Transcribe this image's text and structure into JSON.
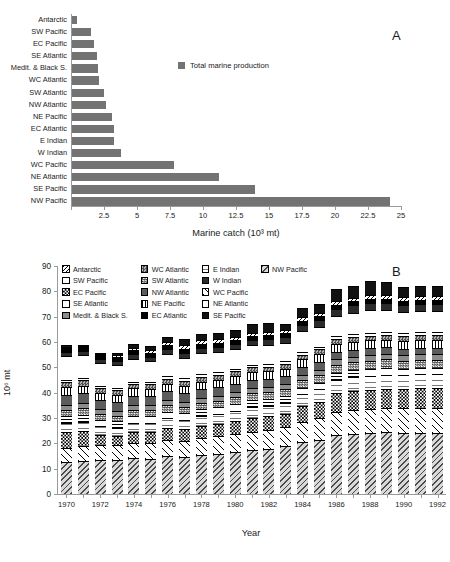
{
  "figure": {
    "panel_a_label": "A",
    "panel_b_label": "B"
  },
  "panel_a": {
    "legend_label": "Total marine production",
    "legend_color": "#737373",
    "xlabel": "Marine catch (10³ mt)",
    "xticks": [
      "",
      "2.5",
      "5",
      "7.5",
      "10",
      "12.5",
      "15",
      "17.5",
      "20",
      "22.5",
      "25"
    ]
  },
  "panel_b": {
    "ylabel": "10⁶ mt",
    "xlabel": "Year",
    "yticks": [
      "0",
      "10",
      "20",
      "30",
      "40",
      "50",
      "60",
      "70",
      "80",
      "90"
    ],
    "xticklabels": [
      "1970",
      "1972",
      "1974",
      "1976",
      "1978",
      "1980",
      "1982",
      "1984",
      "1986",
      "1988",
      "1990",
      "1992"
    ],
    "legend_columns": [
      [
        "Antarctic",
        "SW Pacific",
        "EC Pacific",
        "SE Atlantic",
        "Medit. & Black S."
      ],
      [
        "WC Atlantic",
        "SW Atlantic",
        "NW Atlantic",
        "NE Pacific",
        "EC Atlantic"
      ],
      [
        "E Indian",
        "W Indian",
        "WC Pacific",
        "NE Atlantic",
        "SE Pacific"
      ],
      [
        "NW Pacific"
      ]
    ]
  },
  "chart_data": [
    {
      "type": "bar",
      "orientation": "horizontal",
      "title": "A",
      "xlabel": "Marine catch (10³ mt)",
      "ylabel": "",
      "xlim": [
        0,
        25
      ],
      "xticks": [
        0,
        2.5,
        5,
        7.5,
        10,
        12.5,
        15,
        17.5,
        20,
        22.5,
        25
      ],
      "grid": false,
      "legend": [
        "Total marine production"
      ],
      "legend_position": "upper-center",
      "series_color": "#737373",
      "categories": [
        "Antarctic",
        "SW Pacific",
        "EC Pacific",
        "SE Atlantic",
        "Medit. & Black S.",
        "WC Atlantic",
        "SW Atlantic",
        "NW Atlantic",
        "NE Pacific",
        "EC Atlantic",
        "E Indian",
        "W Indian",
        "WC Pacific",
        "NE Atlantic",
        "SE Pacific",
        "NW Pacific"
      ],
      "values": [
        0.35,
        1.45,
        1.7,
        1.9,
        2.0,
        2.05,
        2.4,
        2.6,
        3.0,
        3.15,
        3.15,
        3.7,
        7.7,
        11.1,
        13.9,
        24.1
      ]
    },
    {
      "type": "bar",
      "subtype": "stacked",
      "title": "B",
      "xlabel": "Year",
      "ylabel": "10⁶ mt",
      "ylim": [
        0,
        90
      ],
      "yticks": [
        0,
        10,
        20,
        30,
        40,
        50,
        60,
        70,
        80,
        90
      ],
      "grid": false,
      "legend_position": "upper-left",
      "categories": [
        1970,
        1971,
        1972,
        1973,
        1974,
        1975,
        1976,
        1977,
        1978,
        1979,
        1980,
        1981,
        1982,
        1983,
        1984,
        1985,
        1986,
        1987,
        1988,
        1989,
        1990,
        1991,
        1992
      ],
      "totals": [
        59.0,
        59.0,
        55.8,
        55.8,
        59.2,
        58.6,
        62.0,
        61.2,
        63.2,
        63.6,
        64.6,
        67.0,
        67.6,
        67.2,
        73.6,
        75.0,
        81.0,
        82.0,
        84.2,
        83.6,
        81.8,
        82.0,
        82.0
      ],
      "series": [
        {
          "name": "NW Pacific",
          "pattern": "diagonal-hatch-gray",
          "values": [
            12.6,
            13.0,
            13.4,
            13.6,
            14.4,
            14.4,
            15.4,
            15.0,
            16.0,
            16.4,
            17.0,
            17.8,
            18.6,
            19.4,
            21.0,
            22.0,
            24.0,
            24.4,
            25.0,
            25.0,
            24.4,
            24.4,
            24.4
          ]
        },
        {
          "name": "WC Pacific",
          "pattern": "diagonal-sparse",
          "values": [
            5.6,
            5.8,
            5.8,
            5.6,
            6.0,
            6.2,
            6.6,
            6.8,
            7.0,
            7.2,
            7.4,
            7.6,
            7.8,
            8.0,
            8.4,
            8.8,
            9.2,
            9.4,
            9.6,
            9.8,
            9.8,
            10.0,
            10.0
          ]
        },
        {
          "name": "EC Pacific",
          "pattern": "checker-coarse",
          "values": [
            6.4,
            6.2,
            4.2,
            3.6,
            4.4,
            4.6,
            5.0,
            4.6,
            4.8,
            5.0,
            5.2,
            5.6,
            5.6,
            5.2,
            6.2,
            6.6,
            7.6,
            7.8,
            8.0,
            7.8,
            7.6,
            7.8,
            7.8
          ]
        },
        {
          "name": "E Indian",
          "pattern": "fine-grid",
          "values": [
            3.6,
            3.6,
            3.4,
            3.4,
            3.6,
            3.6,
            3.8,
            3.8,
            4.0,
            4.0,
            4.2,
            4.4,
            4.4,
            4.4,
            4.8,
            5.0,
            5.4,
            5.6,
            5.6,
            5.6,
            5.6,
            5.6,
            5.6
          ]
        },
        {
          "name": "SE Atlantic",
          "pattern": "grid",
          "values": [
            2.8,
            2.8,
            2.6,
            2.6,
            2.8,
            2.8,
            2.8,
            2.8,
            2.8,
            2.8,
            2.8,
            2.8,
            2.8,
            2.8,
            2.8,
            2.8,
            2.8,
            2.8,
            2.8,
            2.8,
            2.6,
            2.6,
            2.6
          ]
        },
        {
          "name": "SW Atlantic",
          "pattern": "checker-dark",
          "values": [
            2.4,
            2.4,
            2.2,
            2.2,
            2.4,
            2.4,
            2.6,
            2.6,
            2.6,
            2.6,
            2.8,
            2.8,
            2.8,
            2.8,
            3.0,
            3.0,
            3.2,
            3.2,
            3.4,
            3.4,
            3.2,
            3.2,
            3.2
          ]
        },
        {
          "name": "Medit. & Black S.",
          "pattern": "solid-gray",
          "values": [
            2.0,
            2.0,
            1.8,
            1.8,
            2.0,
            2.0,
            2.0,
            2.0,
            2.0,
            2.0,
            2.2,
            2.2,
            2.2,
            2.2,
            2.2,
            2.2,
            2.4,
            2.4,
            2.4,
            2.4,
            2.2,
            2.2,
            2.2
          ]
        },
        {
          "name": "NW Atlantic",
          "pattern": "solid-darkgray",
          "values": [
            4.0,
            4.0,
            3.6,
            3.6,
            3.8,
            3.6,
            3.6,
            3.4,
            3.4,
            3.4,
            3.2,
            3.2,
            3.2,
            3.0,
            3.0,
            3.0,
            2.8,
            2.8,
            2.8,
            2.6,
            2.6,
            2.6,
            2.6
          ]
        },
        {
          "name": "NE Pacific",
          "pattern": "vertical-stripe",
          "values": [
            3.0,
            3.0,
            2.8,
            2.8,
            3.0,
            3.0,
            3.2,
            3.2,
            3.2,
            3.2,
            3.2,
            3.2,
            3.2,
            3.2,
            3.2,
            3.2,
            3.2,
            3.2,
            3.2,
            3.0,
            3.0,
            3.0,
            3.0
          ]
        },
        {
          "name": "WC Atlantic",
          "pattern": "checker-light",
          "values": [
            2.2,
            2.2,
            2.0,
            2.0,
            2.0,
            2.0,
            2.0,
            2.0,
            2.0,
            2.0,
            2.0,
            2.0,
            2.0,
            2.0,
            2.0,
            2.0,
            2.0,
            2.0,
            2.0,
            2.0,
            2.0,
            2.0,
            2.0
          ]
        },
        {
          "name": "SW Pacific",
          "pattern": "white",
          "values": [
            0.8,
            0.8,
            0.8,
            0.8,
            0.8,
            0.8,
            1.0,
            1.0,
            1.0,
            1.0,
            1.0,
            1.0,
            1.0,
            1.0,
            1.0,
            1.0,
            1.2,
            1.2,
            1.2,
            1.2,
            1.2,
            1.2,
            1.2
          ]
        },
        {
          "name": "NE Atlantic",
          "pattern": "white-outline",
          "values": [
            9.6,
            9.2,
            9.0,
            9.0,
            9.2,
            8.6,
            9.2,
            8.4,
            8.6,
            8.4,
            8.0,
            8.0,
            8.0,
            7.6,
            8.4,
            8.2,
            8.4,
            8.6,
            9.2,
            8.8,
            8.4,
            8.4,
            8.4
          ]
        },
        {
          "name": "W Indian",
          "pattern": "solid-black",
          "values": [
            1.6,
            1.6,
            1.6,
            1.6,
            1.8,
            1.8,
            1.8,
            2.0,
            2.0,
            2.0,
            2.2,
            2.2,
            2.4,
            2.4,
            2.6,
            2.6,
            2.8,
            3.0,
            3.0,
            3.0,
            3.0,
            3.0,
            3.0
          ]
        },
        {
          "name": "EC Atlantic",
          "pattern": "solid-black",
          "values": [
            1.6,
            1.6,
            1.6,
            1.6,
            1.6,
            1.6,
            1.6,
            1.6,
            1.6,
            1.6,
            1.6,
            1.6,
            1.6,
            1.6,
            1.6,
            1.6,
            1.6,
            1.6,
            1.6,
            1.6,
            1.6,
            1.6,
            1.6
          ]
        },
        {
          "name": "Antarctic",
          "pattern": "diagonal-hatch-black",
          "values": [
            0.4,
            0.4,
            0.6,
            0.8,
            1.0,
            1.2,
            1.4,
            1.6,
            1.6,
            1.4,
            1.2,
            1.2,
            1.4,
            1.2,
            1.8,
            1.4,
            1.6,
            1.4,
            1.6,
            1.4,
            1.4,
            1.4,
            1.4
          ]
        },
        {
          "name": "SE Pacific",
          "pattern": "solid-black",
          "values": [
            0.8,
            0.4,
            0.4,
            0.8,
            1.4,
            1.6,
            2.0,
            2.4,
            2.6,
            2.6,
            2.6,
            3.4,
            3.6,
            2.4,
            3.6,
            3.6,
            4.8,
            4.6,
            5.8,
            5.2,
            4.2,
            4.0,
            4.0
          ]
        }
      ]
    }
  ]
}
